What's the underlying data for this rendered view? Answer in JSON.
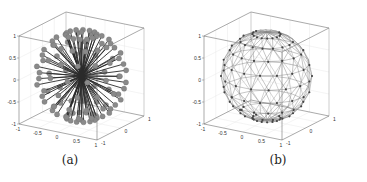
{
  "chart_data": [
    {
      "type": "scatter",
      "subtype": "3d-quiver",
      "panel_label": "(a)",
      "description": "Unit vectors radiating from origin to points distributed on a unit sphere (markers at tips)",
      "xlim": [
        -1,
        1
      ],
      "ylim": [
        -1,
        1
      ],
      "zlim": [
        -1,
        1
      ],
      "x_ticks": [
        "-1",
        "-0.5",
        "0",
        "0.5",
        "1"
      ],
      "y_ticks": [
        "-1",
        "0",
        "1"
      ],
      "z_ticks": [
        "-1",
        "-0.5",
        "0",
        "0.5",
        "1"
      ],
      "grid": true,
      "marker_color": "#8a8a8a",
      "line_color": "#333333"
    },
    {
      "type": "scatter",
      "subtype": "3d-mesh",
      "panel_label": "(b)",
      "description": "Triangulated wireframe mesh of a unit sphere with vertices marked",
      "xlim": [
        -1,
        1
      ],
      "ylim": [
        -1,
        1
      ],
      "zlim": [
        -1,
        1
      ],
      "x_ticks": [
        "-1",
        "-0.5",
        "0",
        "0.5",
        "1"
      ],
      "y_ticks": [
        "-1",
        "0",
        "1"
      ],
      "z_ticks": [
        "-1",
        "-0.5",
        "0",
        "0.5",
        "1"
      ],
      "grid": true,
      "mesh_color": "#777777",
      "vertex_color": "#444444"
    }
  ],
  "captions": {
    "a": "(a)",
    "b": "(b)"
  },
  "ticks": {
    "z": [
      "1",
      "0.5",
      "0",
      "-0.5",
      "-1"
    ],
    "x": [
      "-1",
      "-0.5",
      "0",
      "0.5",
      "1"
    ],
    "y": [
      "-1",
      "0",
      "1"
    ]
  }
}
